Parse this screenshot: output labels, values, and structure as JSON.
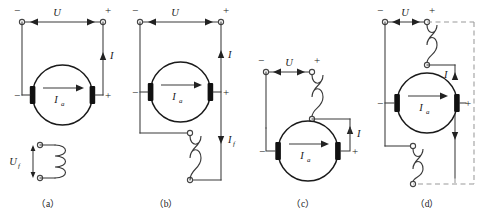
{
  "figure": {
    "background_color": "#ffffff",
    "wire_color": "#3a3a3a",
    "dashed_color": "#9a9a9a",
    "machine_color": "#1a1a1a"
  },
  "symbols": {
    "voltage": "U",
    "field_voltage": "U",
    "field_voltage_sub": "f",
    "line_current": "I",
    "armature_current": "I",
    "armature_current_sub": "a",
    "field_current": "I",
    "field_current_sub": "f",
    "plus": "+",
    "minus": "−"
  },
  "circuits": [
    {
      "id": "a",
      "caption": "（a）",
      "name": "separately-excited",
      "supply_label": "U",
      "supply_minus": "−",
      "supply_plus": "+",
      "line_current_label": "I",
      "armature_label": "I",
      "armature_label_sub": "a",
      "armature_minus": "−",
      "armature_plus": "+",
      "field_voltage_label": "U",
      "field_voltage_label_sub": "f",
      "coil_turns": 3,
      "has_dashed": false
    },
    {
      "id": "b",
      "caption": "（b）",
      "name": "shunt-excited",
      "supply_label": "U",
      "supply_minus": "−",
      "supply_plus": "+",
      "line_current_label": "I",
      "armature_label": "I",
      "armature_label_sub": "a",
      "armature_minus": "−",
      "armature_plus": "+",
      "field_current_label": "I",
      "field_current_label_sub": "f",
      "coil_turns": 4,
      "has_dashed": false
    },
    {
      "id": "c",
      "caption": "（c）",
      "name": "series-excited",
      "supply_label": "U",
      "supply_minus": "−",
      "supply_plus": "+",
      "line_current_label": "I",
      "armature_label": "I",
      "armature_label_sub": "a",
      "armature_minus": "−",
      "armature_plus": "+",
      "coil_turns": 4,
      "has_dashed": false
    },
    {
      "id": "d",
      "caption": "（d）",
      "name": "compound-excited",
      "supply_label": "U",
      "supply_minus": "−",
      "supply_plus": "+",
      "line_current_label": "I",
      "armature_label": "I",
      "armature_label_sub": "a",
      "armature_minus": "−",
      "armature_plus": "+",
      "coil_turns_top": 4,
      "coil_turns_bottom": 4,
      "has_dashed": true
    }
  ]
}
